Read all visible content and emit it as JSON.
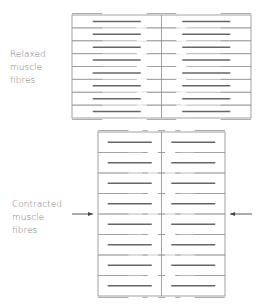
{
  "labels": {
    "relaxed": [
      "Relaxed",
      "muscle",
      "fibres"
    ],
    "contracted": [
      "Contracted",
      "muscle",
      "fibres"
    ]
  },
  "diagram": {
    "relaxed": {
      "x": 72,
      "y": 15,
      "w": 179,
      "h": 103,
      "rows": 8,
      "thick_len": 48,
      "thin_len": 38
    },
    "contracted": {
      "x": 98,
      "y": 132,
      "w": 127,
      "h": 164,
      "rows": 8,
      "thick_len": 44,
      "thin_len": 38
    },
    "colors": {
      "border": "#8a8a8a",
      "thick": "#666666",
      "thin": "#999999"
    }
  }
}
